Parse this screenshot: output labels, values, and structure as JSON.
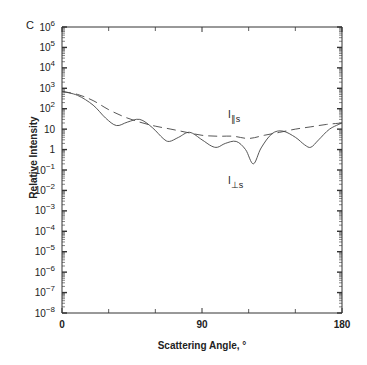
{
  "panel_label": "C",
  "chart_data": {
    "type": "line",
    "title": "",
    "xlabel": "Scattering Angle, °",
    "ylabel": "Relative Intensity",
    "xlim": [
      0,
      180
    ],
    "ylim": [
      1e-08,
      1000000.0
    ],
    "yscale": "log",
    "x_ticks": [
      0,
      90,
      180
    ],
    "x_minor_ticks": [
      30,
      60,
      120,
      150
    ],
    "y_tick_labels": [
      "10^6",
      "10^5",
      "10^4",
      "10^3",
      "10^2",
      "10",
      "1",
      "10^-1",
      "10^-2",
      "10^-3",
      "10^-4",
      "10^-5",
      "10^-6",
      "10^-7",
      "10^-8"
    ],
    "grid": false,
    "legend": "inline annotations",
    "series": [
      {
        "name": "I∥s",
        "style": "dashed",
        "x": [
          0,
          10,
          20,
          30,
          40,
          50,
          60,
          70,
          80,
          90,
          100,
          110,
          120,
          130,
          140,
          150,
          160,
          170,
          180
        ],
        "values": [
          700,
          500,
          250,
          90,
          40,
          22,
          14,
          10,
          7,
          5,
          4.5,
          4.5,
          3.5,
          5,
          7,
          10,
          13,
          17,
          20
        ]
      },
      {
        "name": "I⊥s",
        "style": "solid",
        "x": [
          0,
          10,
          20,
          28,
          35,
          42,
          50,
          58,
          65,
          69,
          75,
          82,
          90,
          96,
          100,
          105,
          112,
          118,
          123,
          128,
          135,
          142,
          150,
          156,
          160,
          165,
          172,
          180
        ],
        "values": [
          700,
          450,
          150,
          35,
          15,
          22,
          30,
          12,
          3.5,
          2.5,
          4,
          7,
          3,
          1.5,
          1.3,
          2,
          2.5,
          1,
          0.2,
          1.2,
          6,
          8,
          4,
          1.7,
          1.3,
          3,
          10,
          20
        ]
      }
    ],
    "annotations": [
      {
        "text": "I∥s",
        "x": 112,
        "y": 40
      },
      {
        "text": "I⊥s",
        "x": 112,
        "y": 0.2
      }
    ]
  }
}
